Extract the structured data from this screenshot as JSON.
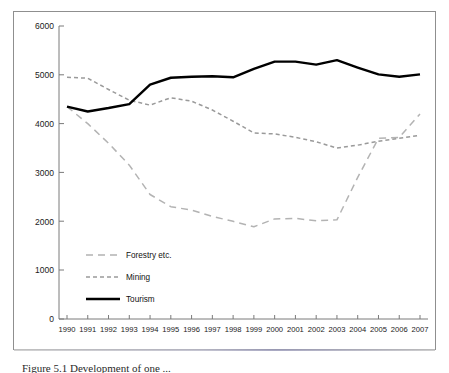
{
  "figure": {
    "caption_partial": "Figure 5.1  Development of one ..."
  },
  "chart_data": {
    "type": "line",
    "title": "",
    "xlabel": "",
    "ylabel": "",
    "ylim": [
      0,
      6000
    ],
    "ytick_values": [
      0,
      1000,
      2000,
      3000,
      4000,
      5000,
      6000
    ],
    "ytick_labels": [
      "0",
      "1000",
      "2000",
      "3000",
      "4000",
      "5000",
      "6000"
    ],
    "grid": false,
    "legend_position": "inside-lower-left",
    "categories": [
      1990,
      1991,
      1992,
      1993,
      1994,
      1995,
      1996,
      1997,
      1998,
      1999,
      2000,
      2001,
      2002,
      2003,
      2004,
      2005,
      2006,
      2007
    ],
    "xtick_labels": [
      "1990",
      "1991",
      "1992",
      "1993",
      "1994",
      "1995",
      "1996",
      "1997",
      "1998",
      "1999",
      "2000",
      "2001",
      "2002",
      "2003",
      "2004",
      "2005",
      "2006",
      "2007"
    ],
    "series": [
      {
        "name": "Forestry etc.",
        "style": "long-dashed",
        "color": "#b3b3b3",
        "values": [
          4350,
          4000,
          3600,
          3150,
          2550,
          2300,
          2230,
          2100,
          2000,
          1890,
          2050,
          2060,
          2010,
          2030,
          2900,
          3700,
          3720,
          4200
        ]
      },
      {
        "name": "Mining",
        "style": "short-dashed",
        "color": "#9a9a9a",
        "values": [
          4950,
          4930,
          4700,
          4480,
          4380,
          4530,
          4460,
          4280,
          4050,
          3810,
          3790,
          3720,
          3630,
          3500,
          3560,
          3640,
          3700,
          3760
        ]
      },
      {
        "name": "Tourism",
        "style": "solid",
        "color": "#000000",
        "values": [
          4350,
          4250,
          4320,
          4400,
          4800,
          4940,
          4960,
          4970,
          4950,
          5120,
          5270,
          5270,
          5210,
          5300,
          5150,
          5010,
          4960,
          5010
        ]
      }
    ]
  },
  "legend": {
    "items": [
      {
        "label": "Forestry etc."
      },
      {
        "label": "Mining"
      },
      {
        "label": "Tourism"
      }
    ]
  }
}
